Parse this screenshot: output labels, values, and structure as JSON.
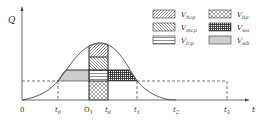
{
  "axes": {
    "y_label": "Q",
    "x_label": "t"
  },
  "x_ticks": [
    {
      "id": "origin",
      "label": "0",
      "sub": "",
      "x": 22
    },
    {
      "id": "t0",
      "label": "t",
      "sub": "0",
      "x": 58
    },
    {
      "id": "O1",
      "label": "O",
      "sub": "1",
      "x": 89
    },
    {
      "id": "td",
      "label": "t",
      "sub": "d",
      "x": 108
    },
    {
      "id": "t1",
      "label": "t",
      "sub": "1",
      "x": 137
    },
    {
      "id": "t2",
      "label": "t",
      "sub": "2",
      "x": 176
    },
    {
      "id": "t3",
      "label": "t",
      "sub": "3",
      "x": 227
    }
  ],
  "legend": [
    {
      "id": "hcp",
      "symbol": "V",
      "sub": "hcp",
      "pattern": "diag-forward"
    },
    {
      "id": "mcp",
      "symbol": "V",
      "sub": "mcp",
      "pattern": "diag-back"
    },
    {
      "id": "lcp",
      "symbol": "V",
      "sub": "lcp",
      "pattern": "horizontal"
    },
    {
      "id": "bp",
      "symbol": "V",
      "sub": "bp",
      "pattern": "crosshatch"
    },
    {
      "id": "wa",
      "symbol": "V",
      "sub": "wa",
      "pattern": "grid-dense"
    },
    {
      "id": "wb",
      "symbol": "V",
      "sub": "wb",
      "pattern": "vertical"
    }
  ],
  "colors": {
    "line": "#333333",
    "axis": "#444444",
    "background": "#ffffff"
  }
}
